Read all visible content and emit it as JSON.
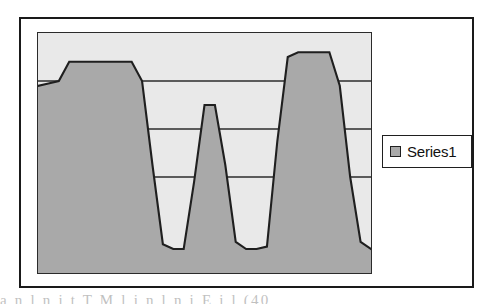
{
  "figure": {
    "background_color": "#ffffff",
    "frame_border_color": "#1a1a1a",
    "caption_fragment": "a     n   l    n   i  t   T     M  l i     n   l    n   i   E  i    l    (40"
  },
  "legend": {
    "label": "Series1",
    "swatch_color": "#a9a9a9",
    "border_color": "#1f1f1f",
    "position": "right"
  },
  "chart_data": {
    "type": "area",
    "title": "",
    "subtitle": "",
    "xlabel": "",
    "ylabel": "",
    "grid": true,
    "grid_orientation": "horizontal",
    "gridline_values": [
      0.8,
      0.6,
      0.4
    ],
    "legend_position": "right",
    "series": [
      {
        "name": "Series1",
        "fill_color": "#a9a9a9",
        "line_color": "#1f1f1f",
        "x": [
          0,
          1,
          2,
          3,
          4,
          5,
          6,
          7,
          8,
          9,
          10,
          11,
          12,
          13,
          14,
          15,
          16,
          17,
          18,
          19,
          20,
          21,
          22,
          23,
          24,
          25,
          26,
          27,
          28,
          29,
          30,
          31,
          32
        ],
        "values": [
          0.78,
          0.79,
          0.8,
          0.88,
          0.88,
          0.88,
          0.88,
          0.88,
          0.88,
          0.88,
          0.8,
          0.45,
          0.12,
          0.1,
          0.1,
          0.38,
          0.7,
          0.7,
          0.45,
          0.13,
          0.1,
          0.1,
          0.11,
          0.55,
          0.9,
          0.92,
          0.92,
          0.92,
          0.92,
          0.78,
          0.4,
          0.13,
          0.1
        ]
      }
    ],
    "ylim": [
      0,
      1
    ],
    "xlim": [
      0,
      32
    ],
    "ytick_labels": [],
    "xtick_labels": [],
    "annotations": []
  },
  "axes": {
    "plot_background": "#e9e9e9",
    "plot_border_color": "#2b2b2b",
    "ticks_visible": false,
    "tick_labels_visible": false
  }
}
